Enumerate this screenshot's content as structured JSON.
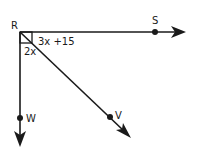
{
  "diagram": {
    "type": "angle-diagram",
    "vertex": {
      "label": "R"
    },
    "rays": [
      {
        "label": "S",
        "direction": "right"
      },
      {
        "label": "V",
        "direction": "down-right"
      },
      {
        "label": "W",
        "direction": "down"
      }
    ],
    "angles": [
      {
        "label": "3x +15",
        "between": [
          "RS",
          "RV"
        ]
      },
      {
        "label": "2x",
        "between": [
          "RV",
          "RW"
        ]
      }
    ],
    "right_angle_marker": {
      "between": [
        "RS",
        "RW"
      ]
    },
    "colors": {
      "stroke": "#1a1a1a",
      "background": "#ffffff"
    }
  }
}
